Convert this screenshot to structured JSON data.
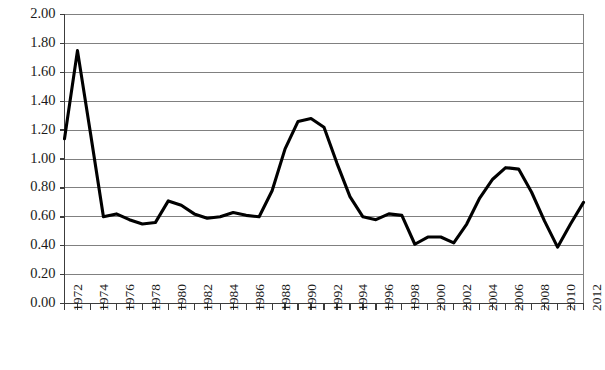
{
  "chart_data": {
    "type": "line",
    "title": "",
    "subtitle": "",
    "xlabel": "",
    "ylabel": "",
    "ylim": [
      0.0,
      2.0
    ],
    "xlim": [
      1972,
      2012
    ],
    "ytick_step": 0.2,
    "xtick_step_labeled": 2,
    "xtick_step_minor": 1,
    "grid": "horizontal",
    "legend": "none",
    "line_color": "#000000",
    "grid_color": "#808080",
    "axis_color": "#555555",
    "ytick_labels": [
      "0.00",
      "0.20",
      "0.40",
      "0.60",
      "0.80",
      "1.00",
      "1.20",
      "1.40",
      "1.60",
      "1.80",
      "2.00"
    ],
    "ytick_values": [
      0.0,
      0.2,
      0.4,
      0.6,
      0.8,
      1.0,
      1.2,
      1.4,
      1.6,
      1.8,
      2.0
    ],
    "xtick_labels": [
      "1972",
      "1974",
      "1976",
      "1978",
      "1980",
      "1982",
      "1984",
      "1986",
      "1988",
      "1990",
      "1992",
      "1994",
      "1996",
      "1998",
      "2000",
      "2002",
      "2004",
      "2006",
      "2008",
      "2010",
      "2012"
    ],
    "x": [
      1972,
      1973,
      1974,
      1975,
      1976,
      1977,
      1978,
      1979,
      1980,
      1981,
      1982,
      1983,
      1984,
      1985,
      1986,
      1987,
      1988,
      1989,
      1990,
      1991,
      1992,
      1993,
      1994,
      1995,
      1996,
      1997,
      1998,
      1999,
      2000,
      2001,
      2002,
      2003,
      2004,
      2005,
      2006,
      2007,
      2008,
      2009,
      2010,
      2011,
      2012
    ],
    "values": [
      1.14,
      1.75,
      1.18,
      0.6,
      0.62,
      0.58,
      0.55,
      0.56,
      0.71,
      0.68,
      0.62,
      0.59,
      0.6,
      0.63,
      0.61,
      0.6,
      0.78,
      1.07,
      1.26,
      1.28,
      1.22,
      0.97,
      0.74,
      0.6,
      0.58,
      0.62,
      0.61,
      0.41,
      0.46,
      0.46,
      0.42,
      0.55,
      0.73,
      0.86,
      0.94,
      0.93,
      0.77,
      0.57,
      0.39,
      0.55,
      0.7
    ],
    "series": [
      {
        "name": "series-1",
        "values": [
          1.14,
          1.75,
          1.18,
          0.6,
          0.62,
          0.58,
          0.55,
          0.56,
          0.71,
          0.68,
          0.62,
          0.59,
          0.6,
          0.63,
          0.61,
          0.6,
          0.78,
          1.07,
          1.26,
          1.28,
          1.22,
          0.97,
          0.74,
          0.6,
          0.58,
          0.62,
          0.61,
          0.41,
          0.46,
          0.46,
          0.42,
          0.55,
          0.73,
          0.86,
          0.94,
          0.93,
          0.77,
          0.57,
          0.39,
          0.55,
          0.7
        ]
      }
    ]
  }
}
